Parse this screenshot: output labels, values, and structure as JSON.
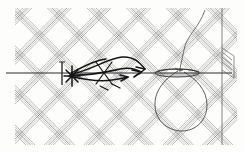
{
  "image": {
    "title": "Crosshatched lattice line drawing",
    "kind": "monochrome pen-and-ink line diagram",
    "width": 245,
    "height": 152,
    "background_color": "#fdfdfc",
    "ink_color": "#2b2b2b",
    "light_ink_color": "#8a8a8a",
    "mid_ink_color": "#5c5c5c"
  },
  "canvas": {
    "margin_left": 15,
    "margin_right": 8,
    "margin_top": 8,
    "margin_bottom": 7,
    "content_left": 15,
    "content_right": 237,
    "content_top": 8,
    "content_bottom": 145
  },
  "elements": {
    "hatching": {
      "label": "crosshatch lattice",
      "description": "two families of parallel line bundles crossing at plus and minus 45 degrees",
      "angle_a_deg": 45,
      "angle_b_deg": -45,
      "lines_per_bundle": 5,
      "line_spacing_px": 1.6,
      "bundle_spacing_px": 28,
      "stroke_width": 0.5,
      "color": "#6e6e6e"
    },
    "baseline": {
      "label": "horizontal baseline",
      "y": 73,
      "x_start": 6,
      "x_end": 232,
      "stroke_width": 1.0,
      "color": "#2b2b2b"
    },
    "right_border": {
      "label": "vertical right border",
      "x": 222,
      "y_start": 8,
      "y_end": 145,
      "stroke_width": 0.7,
      "color": "#4a4a4a"
    },
    "left_tick": {
      "label": "short vertical tick on baseline",
      "x": 62,
      "y_top": 62,
      "y_bottom": 85,
      "stroke_width": 1.4,
      "color": "#2b2b2b"
    },
    "arrow_cluster": {
      "label": "converging dark arrow strokes",
      "origin_x": 70,
      "origin_y": 74,
      "arrow_count": 4,
      "tips": [
        {
          "x": 142,
          "y": 70
        },
        {
          "x": 137,
          "y": 77
        },
        {
          "x": 127,
          "y": 64
        },
        {
          "x": 120,
          "y": 80
        }
      ],
      "stroke_width": 1.6,
      "color": "#141414"
    },
    "lens": {
      "label": "flattened lens ellipse on baseline",
      "cx": 177,
      "cy": 73,
      "rx": 22,
      "ry": 4,
      "stroke_width": 0.9,
      "color": "#2b2b2b"
    },
    "loop": {
      "label": "large teardrop loop",
      "cx": 180,
      "cy": 104,
      "rx": 27,
      "ry": 25,
      "neck_x": 176,
      "neck_y": 70,
      "stroke_width": 0.8,
      "color": "#333333"
    },
    "tail_curve": {
      "label": "thin curve descending from top right",
      "start_x": 205,
      "start_y": 10,
      "end_x": 181,
      "end_y": 72,
      "stroke_width": 0.7,
      "color": "#3a3a3a"
    },
    "corner_flap": {
      "label": "small folded flap at right border",
      "x": 222,
      "y": 48,
      "width": 12,
      "height": 30,
      "stroke_width": 0.7,
      "color": "#4a4a4a"
    }
  }
}
